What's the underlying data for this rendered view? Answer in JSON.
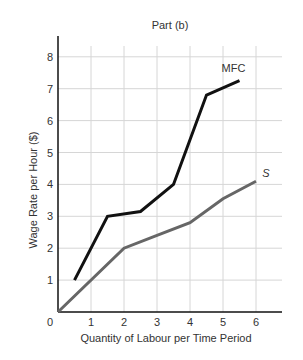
{
  "chart_data": {
    "type": "line",
    "title": "Part (b)",
    "xlabel": "Quantity of Labour per Time Period",
    "ylabel": "Wage Rate per Hour ($)",
    "xlim": [
      0,
      6.7
    ],
    "ylim": [
      0,
      8.7
    ],
    "grid": true,
    "origin_label": "0",
    "x_ticks": [
      1,
      2,
      3,
      4,
      5,
      6
    ],
    "y_ticks": [
      1,
      2,
      3,
      4,
      5,
      6,
      7,
      8
    ],
    "series": [
      {
        "name": "MFC",
        "label": "MFC",
        "color": "#111111",
        "points": [
          [
            0.5,
            1.0
          ],
          [
            1.5,
            3.0
          ],
          [
            2.5,
            3.15
          ],
          [
            3.5,
            4.0
          ],
          [
            4.5,
            6.8
          ],
          [
            5.5,
            7.25
          ]
        ]
      },
      {
        "name": "S",
        "label": "S",
        "color": "#666666",
        "points": [
          [
            0,
            0
          ],
          [
            2,
            2.0
          ],
          [
            3,
            2.4
          ],
          [
            4,
            2.8
          ],
          [
            5,
            3.55
          ],
          [
            6,
            4.1
          ]
        ]
      }
    ]
  }
}
